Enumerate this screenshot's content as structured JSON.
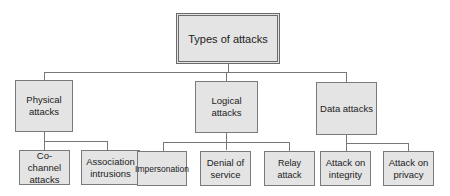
{
  "diagram": {
    "title": "Types of attacks",
    "root": {
      "label": "Types of attacks"
    },
    "categories": [
      {
        "label": "Physical\nattacks",
        "children": [
          {
            "label": "Co-channel attacks"
          },
          {
            "label": "Association intrusions"
          }
        ]
      },
      {
        "label": "Logical attacks",
        "children": [
          {
            "label": "Impersonation"
          },
          {
            "label": "Denial of service"
          },
          {
            "label": "Relay attack"
          }
        ]
      },
      {
        "label": "Data attacks",
        "children": [
          {
            "label": "Attack on integrity"
          },
          {
            "label": "Attack on privacy"
          }
        ]
      }
    ],
    "colors": {
      "box_fill": "#e4e4e4",
      "border": "#7a7a7a",
      "line": "#777777"
    }
  }
}
